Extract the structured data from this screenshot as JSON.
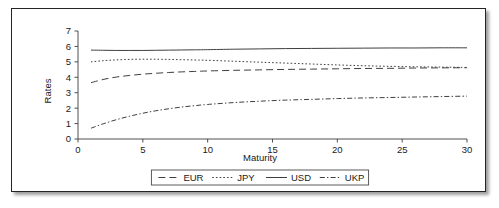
{
  "chart_data": {
    "type": "line",
    "title": "",
    "xlabel": "Maturity",
    "ylabel": "Rates",
    "xlim": [
      0,
      30
    ],
    "ylim": [
      0,
      7
    ],
    "xticks": [
      0,
      5,
      10,
      15,
      20,
      25,
      30
    ],
    "yticks": [
      0,
      1,
      2,
      3,
      4,
      5,
      6,
      7
    ],
    "grid": false,
    "legend_position": "bottom-center",
    "x": [
      1,
      2,
      3,
      4,
      5,
      6,
      7,
      8,
      9,
      10,
      12,
      14,
      16,
      18,
      20,
      22,
      24,
      26,
      28,
      30
    ],
    "series": [
      {
        "name": "EUR",
        "style": "dashed",
        "values": [
          3.65,
          3.87,
          4.02,
          4.12,
          4.2,
          4.26,
          4.31,
          4.35,
          4.38,
          4.41,
          4.45,
          4.48,
          4.51,
          4.53,
          4.55,
          4.57,
          4.58,
          4.6,
          4.61,
          4.62
        ]
      },
      {
        "name": "JPY",
        "style": "dotted",
        "values": [
          5.0,
          5.08,
          5.13,
          5.16,
          5.17,
          5.17,
          5.16,
          5.14,
          5.12,
          5.1,
          5.04,
          4.98,
          4.92,
          4.86,
          4.8,
          4.75,
          4.71,
          4.68,
          4.66,
          4.64
        ]
      },
      {
        "name": "USD",
        "style": "solid",
        "values": [
          5.76,
          5.75,
          5.74,
          5.74,
          5.74,
          5.75,
          5.76,
          5.77,
          5.78,
          5.79,
          5.82,
          5.84,
          5.86,
          5.87,
          5.88,
          5.89,
          5.9,
          5.9,
          5.91,
          5.91
        ]
      },
      {
        "name": "UKP",
        "style": "dashdot",
        "values": [
          0.7,
          1.0,
          1.26,
          1.48,
          1.67,
          1.83,
          1.96,
          2.07,
          2.16,
          2.24,
          2.36,
          2.45,
          2.52,
          2.57,
          2.62,
          2.66,
          2.69,
          2.72,
          2.75,
          2.78
        ]
      }
    ],
    "legend_entries": [
      {
        "label": "EUR",
        "style": "dashed"
      },
      {
        "label": "JPY",
        "style": "dotted"
      },
      {
        "label": "USD",
        "style": "solid"
      },
      {
        "label": "UKP",
        "style": "dashdot"
      }
    ],
    "axis_colors": {
      "axis": "#3c3c3c",
      "line": "#3f3f3f",
      "text": "#1a1a1a"
    },
    "frame": {
      "border_color": "#242424",
      "background": "#ffffff"
    }
  }
}
